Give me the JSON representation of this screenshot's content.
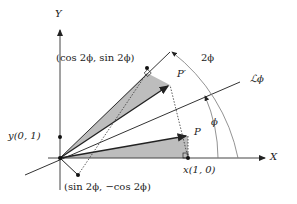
{
  "diagram": {
    "labels": {
      "y_axis": "Y",
      "x_axis": "X",
      "top_point": "(cos 2ϕ,  sin 2ϕ)",
      "p_prime": "P′",
      "p": "P",
      "line": "ℒϕ",
      "angle_2phi": "2ϕ",
      "angle_phi": "ϕ",
      "y_unit": "y(0, 1)",
      "x_unit": "x(1, 0)",
      "bottom_point": "(sin 2ϕ,  −cos 2ϕ)"
    },
    "colors": {
      "stroke": "#222222",
      "fill_gray": "#bdbdbd",
      "arc": "#666666"
    }
  }
}
